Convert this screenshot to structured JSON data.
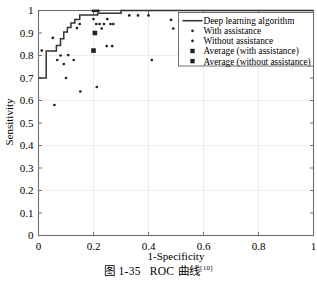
{
  "caption": {
    "figure_number": "图 1-35",
    "title": "ROC 曲线",
    "reference": "[10]"
  },
  "chart_data": {
    "type": "line",
    "title": "",
    "xlabel": "1-Specificity",
    "ylabel": "Sensitivity",
    "xlim": [
      0,
      1
    ],
    "ylim": [
      0,
      1
    ],
    "xticks": [
      "0",
      "0.2",
      "0.4",
      "0.6",
      "0.8",
      "1"
    ],
    "xtick_values": [
      0,
      0.2,
      0.4,
      0.6,
      0.8,
      1
    ],
    "yticks": [
      "0",
      "0.1",
      "0.2",
      "0.3",
      "0.4",
      "0.5",
      "0.6",
      "0.7",
      "0.8",
      "0.9",
      "1"
    ],
    "ytick_values": [
      0,
      0.1,
      0.2,
      0.3,
      0.4,
      0.5,
      0.6,
      0.7,
      0.8,
      0.9,
      1
    ],
    "grid": true,
    "legend_position": "upper right",
    "series": [
      {
        "name": "Deep learning algorithm",
        "marker": "line",
        "type": "step",
        "points": [
          [
            0.0,
            0.7
          ],
          [
            0.028,
            0.7
          ],
          [
            0.028,
            0.82
          ],
          [
            0.065,
            0.82
          ],
          [
            0.065,
            0.845
          ],
          [
            0.08,
            0.845
          ],
          [
            0.08,
            0.875
          ],
          [
            0.092,
            0.875
          ],
          [
            0.092,
            0.905
          ],
          [
            0.105,
            0.905
          ],
          [
            0.105,
            0.925
          ],
          [
            0.118,
            0.925
          ],
          [
            0.118,
            0.945
          ],
          [
            0.132,
            0.945
          ],
          [
            0.132,
            0.96
          ],
          [
            0.15,
            0.96
          ],
          [
            0.15,
            0.98
          ],
          [
            0.215,
            0.98
          ],
          [
            0.215,
            0.988
          ],
          [
            0.3,
            0.988
          ],
          [
            0.3,
            1.0
          ],
          [
            1.0,
            1.0
          ]
        ]
      },
      {
        "name": "With assistance",
        "marker": "dot",
        "points": [
          [
            0.012,
            0.822
          ],
          [
            0.052,
            0.878
          ],
          [
            0.058,
            0.58
          ],
          [
            0.068,
            0.78
          ],
          [
            0.08,
            0.8
          ],
          [
            0.092,
            0.762
          ],
          [
            0.1,
            0.7
          ],
          [
            0.108,
            0.802
          ],
          [
            0.128,
            0.78
          ],
          [
            0.14,
            0.922
          ],
          [
            0.15,
            0.94
          ],
          [
            0.152,
            0.64
          ],
          [
            0.198,
            0.998
          ],
          [
            0.205,
            0.998
          ],
          [
            0.212,
            0.998
          ],
          [
            0.218,
            0.998
          ],
          [
            0.2,
            0.962
          ],
          [
            0.21,
            0.94
          ],
          [
            0.222,
            0.94
          ],
          [
            0.238,
            0.94
          ],
          [
            0.25,
            0.962
          ],
          [
            0.262,
            0.94
          ],
          [
            0.272,
            0.94
          ],
          [
            0.23,
            0.92
          ],
          [
            0.248,
            0.842
          ],
          [
            0.268,
            0.842
          ],
          [
            0.212,
            0.66
          ],
          [
            0.33,
            0.978
          ],
          [
            0.362,
            0.978
          ],
          [
            0.4,
            0.978
          ],
          [
            0.412,
            0.78
          ],
          [
            0.482,
            0.958
          ],
          [
            0.49,
            0.92
          ]
        ]
      },
      {
        "name": "Without assistance",
        "marker": "dot",
        "points": []
      },
      {
        "name": "Average (with assistance)",
        "marker": "square",
        "points": [
          [
            0.205,
            0.9
          ]
        ]
      },
      {
        "name": "Average (without assistance)",
        "marker": "square",
        "points": [
          [
            0.2,
            0.822
          ]
        ]
      }
    ],
    "legend_entries": [
      {
        "label": "Deep learning algorithm",
        "marker": "line"
      },
      {
        "label": "With assistance",
        "marker": "dot"
      },
      {
        "label": "Without assistance",
        "marker": "dot"
      },
      {
        "label": "Average (with assistance)",
        "marker": "square"
      },
      {
        "label": "Average (without assistance)",
        "marker": "square"
      }
    ],
    "colors": {
      "line": "#333333",
      "marker": "#222222",
      "axis": "#6e6e6e",
      "grid": "#e9e9e9"
    }
  }
}
